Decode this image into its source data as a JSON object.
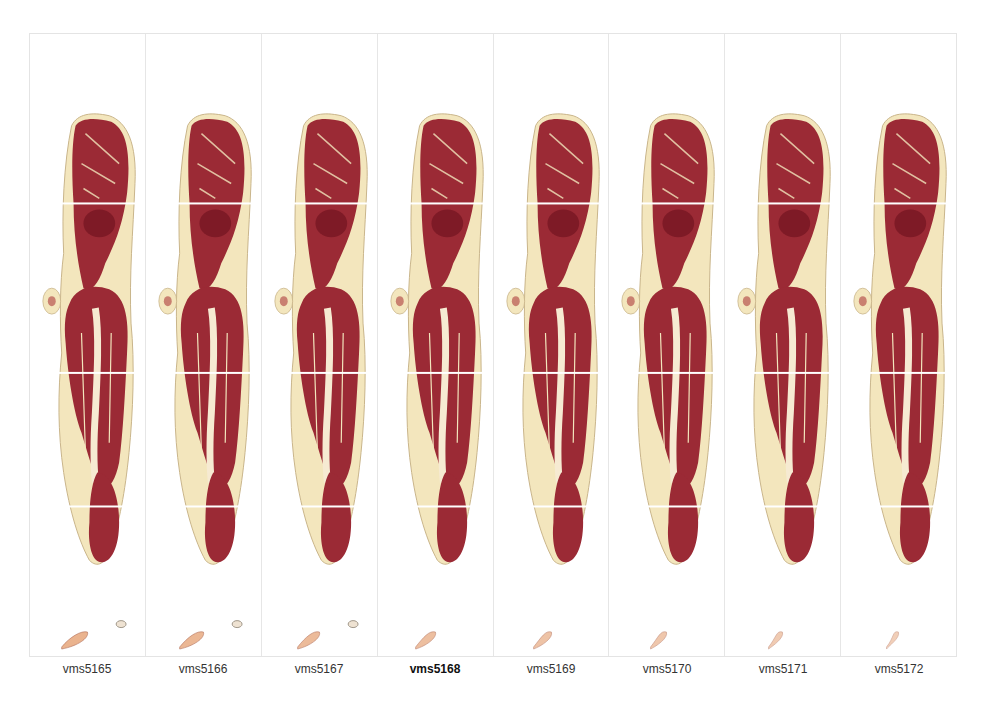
{
  "figure": {
    "panels": [
      {
        "label": "vms5165",
        "bold": false,
        "extra_fragment": true
      },
      {
        "label": "vms5166",
        "bold": false,
        "extra_fragment": true
      },
      {
        "label": "vms5167",
        "bold": false,
        "extra_fragment": true
      },
      {
        "label": "vms5168",
        "bold": true,
        "extra_fragment": false
      },
      {
        "label": "vms5169",
        "bold": false,
        "extra_fragment": false
      },
      {
        "label": "vms5170",
        "bold": false,
        "extra_fragment": false
      },
      {
        "label": "vms5171",
        "bold": false,
        "extra_fragment": false
      },
      {
        "label": "vms5172",
        "bold": false,
        "extra_fragment": false
      }
    ],
    "colors": {
      "muscle": "#9b2a35",
      "muscle_dark": "#7e1a26",
      "fat": "#f3e6bd",
      "skin_edge": "#c9b48a",
      "bone": "#f6ead2",
      "divider": "#e6e6e6"
    }
  }
}
